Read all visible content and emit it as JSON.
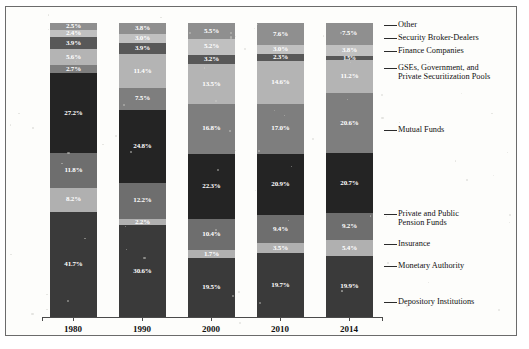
{
  "chart_data": {
    "type": "bar",
    "title": "",
    "xlabel": "",
    "ylabel": "",
    "ylim": [
      0,
      100
    ],
    "grid": false,
    "stacked": true,
    "legend_position": "right-leader-labels",
    "categories": [
      "1980",
      "1990",
      "2000",
      "2010",
      "2014"
    ],
    "series": [
      {
        "name": "Depository Institutions",
        "color": "#2b2b2b",
        "values": [
          41.7,
          30.6,
          19.5,
          19.7,
          19.9
        ]
      },
      {
        "name": "Monetary Authority",
        "color": "#adadad",
        "values": [
          0.6,
          2.2,
          1.7,
          3.5,
          5.4
        ]
      },
      {
        "name": "Insurance",
        "color": "#6e6e6e",
        "values": [
          8.2,
          12.2,
          10.4,
          9.4,
          9.2
        ]
      },
      {
        "name": "Private and Public\nPension Funds",
        "color": "#222222",
        "values": [
          11.8,
          24.8,
          22.3,
          20.9,
          20.7
        ]
      },
      {
        "name": "Mutual Funds",
        "color": "#6b6b6b",
        "values": [
          27.2,
          7.5,
          16.8,
          17.0,
          20.6
        ]
      },
      {
        "name": "GSEs, Government, and\nPrivate Securitization Pools",
        "color": "#a8a8a8",
        "values": [
          2.7,
          11.4,
          13.5,
          14.6,
          11.2
        ]
      },
      {
        "name": "Finance Companies",
        "color": "#585858",
        "values": [
          3.9,
          3.9,
          3.2,
          2.3,
          1.5
        ]
      },
      {
        "name": "Security Broker-Dealers",
        "color": "#c0c0c0",
        "values": [
          2.4,
          3.0,
          5.2,
          3.0,
          3.8
        ]
      },
      {
        "name": "Other",
        "color": "#8f8f8f",
        "values": [
          2.5,
          3.8,
          5.5,
          7.6,
          7.5
        ]
      }
    ],
    "columns": [
      {
        "year": "1980",
        "segments": [
          {
            "label": "Other",
            "value": "2.5%",
            "pct": 2.5,
            "color": "#8f8f8f",
            "text": "#ffffff"
          },
          {
            "label": "Security Broker-Dealers",
            "value": "2.4%",
            "pct": 2.4,
            "color": "#c0c0c0",
            "text": "#ffffff"
          },
          {
            "label": "Finance Companies",
            "value": "3.9%",
            "pct": 3.9,
            "color": "#585858",
            "text": "#ffffff"
          },
          {
            "label": "GSEs, Government, and Private Securitization Pools",
            "value": "5.6%",
            "pct": 5.6,
            "color": "#b4b4b4",
            "text": "#ffffff"
          },
          {
            "label": "Mutual Funds",
            "value": "2.7%",
            "pct": 2.7,
            "color": "#7e7e7e",
            "text": "#ffffff"
          },
          {
            "label": "Private and Public Pension Funds",
            "value": "27.2%",
            "pct": 27.2,
            "color": "#242424",
            "text": "#ffffff"
          },
          {
            "label": "Insurance",
            "value": "11.8%",
            "pct": 11.8,
            "color": "#6e6e6e",
            "text": "#ffffff"
          },
          {
            "label": "Monetary Authority",
            "value": "8.2%",
            "pct": 8.2,
            "color": "#b0b0b0",
            "text": "#ffffff"
          },
          {
            "label": "Depository Institutions",
            "value": "41.7%",
            "pct": 35.7,
            "color": "#3a3a3a",
            "text": "#ffffff"
          }
        ]
      },
      {
        "year": "1990",
        "segments": [
          {
            "label": "Other",
            "value": "3.8%",
            "pct": 3.8,
            "color": "#8f8f8f",
            "text": "#ffffff"
          },
          {
            "label": "Security Broker-Dealers",
            "value": "3.0%",
            "pct": 3.0,
            "color": "#c0c0c0",
            "text": "#ffffff"
          },
          {
            "label": "Finance Companies",
            "value": "3.9%",
            "pct": 3.9,
            "color": "#585858",
            "text": "#ffffff"
          },
          {
            "label": "GSEs, Government, and Private Securitization Pools",
            "value": "11.4%",
            "pct": 11.4,
            "color": "#b4b4b4",
            "text": "#ffffff"
          },
          {
            "label": "Mutual Funds",
            "value": "7.5%",
            "pct": 7.5,
            "color": "#7e7e7e",
            "text": "#ffffff"
          },
          {
            "label": "Private and Public Pension Funds",
            "value": "24.8%",
            "pct": 24.8,
            "color": "#242424",
            "text": "#ffffff"
          },
          {
            "label": "Insurance",
            "value": "12.2%",
            "pct": 12.2,
            "color": "#6e6e6e",
            "text": "#ffffff"
          },
          {
            "label": "Monetary Authority",
            "value": "2.2%",
            "pct": 2.2,
            "color": "#b0b0b0",
            "text": "#ffffff"
          },
          {
            "label": "Depository Institutions",
            "value": "30.6%",
            "pct": 31.2,
            "color": "#3a3a3a",
            "text": "#ffffff"
          }
        ]
      },
      {
        "year": "2000",
        "segments": [
          {
            "label": "Other",
            "value": "5.5%",
            "pct": 5.5,
            "color": "#8f8f8f",
            "text": "#ffffff"
          },
          {
            "label": "Security Broker-Dealers",
            "value": "5.2%",
            "pct": 5.2,
            "color": "#c0c0c0",
            "text": "#ffffff"
          },
          {
            "label": "Finance Companies",
            "value": "3.2%",
            "pct": 3.2,
            "color": "#585858",
            "text": "#ffffff"
          },
          {
            "label": "GSEs, Government, and Private Securitization Pools",
            "value": "13.5%",
            "pct": 13.5,
            "color": "#b4b4b4",
            "text": "#ffffff"
          },
          {
            "label": "Mutual Funds",
            "value": "16.8%",
            "pct": 16.8,
            "color": "#7e7e7e",
            "text": "#ffffff"
          },
          {
            "label": "Private and Public Pension Funds",
            "value": "22.3%",
            "pct": 22.3,
            "color": "#242424",
            "text": "#ffffff"
          },
          {
            "label": "Insurance",
            "value": "10.4%",
            "pct": 10.4,
            "color": "#6e6e6e",
            "text": "#ffffff"
          },
          {
            "label": "Monetary Authority",
            "value": "1.7%",
            "pct": 2.6,
            "color": "#b0b0b0",
            "text": "#ffffff"
          },
          {
            "label": "Depository Institutions",
            "value": "19.5%",
            "pct": 20.0,
            "color": "#3a3a3a",
            "text": "#ffffff"
          }
        ]
      },
      {
        "year": "2010",
        "segments": [
          {
            "label": "Other",
            "value": "7.6%",
            "pct": 7.6,
            "color": "#8f8f8f",
            "text": "#ffffff"
          },
          {
            "label": "Security Broker-Dealers",
            "value": "3.0%",
            "pct": 3.0,
            "color": "#c0c0c0",
            "text": "#ffffff"
          },
          {
            "label": "Finance Companies",
            "value": "2.3%",
            "pct": 2.3,
            "color": "#585858",
            "text": "#ffffff"
          },
          {
            "label": "GSEs, Government, and Private Securitization Pools",
            "value": "14.6%",
            "pct": 14.6,
            "color": "#b4b4b4",
            "text": "#ffffff"
          },
          {
            "label": "Mutual Funds",
            "value": "17.0%",
            "pct": 17.0,
            "color": "#7e7e7e",
            "text": "#ffffff"
          },
          {
            "label": "Private and Public Pension Funds",
            "value": "20.9%",
            "pct": 20.9,
            "color": "#242424",
            "text": "#ffffff"
          },
          {
            "label": "Insurance",
            "value": "9.4%",
            "pct": 9.4,
            "color": "#6e6e6e",
            "text": "#ffffff"
          },
          {
            "label": "Monetary Authority",
            "value": "3.5%",
            "pct": 3.5,
            "color": "#b0b0b0",
            "text": "#ffffff"
          },
          {
            "label": "Depository Institutions",
            "value": "19.7%",
            "pct": 21.7,
            "color": "#3a3a3a",
            "text": "#ffffff"
          }
        ]
      },
      {
        "year": "2014",
        "segments": [
          {
            "label": "Other",
            "value": "7.5%",
            "pct": 7.5,
            "color": "#8f8f8f",
            "text": "#ffffff"
          },
          {
            "label": "Security Broker-Dealers",
            "value": "3.8%",
            "pct": 3.8,
            "color": "#c0c0c0",
            "text": "#ffffff"
          },
          {
            "label": "Finance Companies",
            "value": "1.5%",
            "pct": 1.5,
            "color": "#585858",
            "text": "#ffffff"
          },
          {
            "label": "GSEs, Government, and Private Securitization Pools",
            "value": "11.2%",
            "pct": 11.2,
            "color": "#b4b4b4",
            "text": "#ffffff"
          },
          {
            "label": "Mutual Funds",
            "value": "20.6%",
            "pct": 20.6,
            "color": "#7e7e7e",
            "text": "#ffffff"
          },
          {
            "label": "Private and Public Pension Funds",
            "value": "20.7%",
            "pct": 20.7,
            "color": "#242424",
            "text": "#ffffff"
          },
          {
            "label": "Insurance",
            "value": "9.2%",
            "pct": 9.2,
            "color": "#6e6e6e",
            "text": "#ffffff"
          },
          {
            "label": "Monetary Authority",
            "value": "5.4%",
            "pct": 5.4,
            "color": "#b0b0b0",
            "text": "#ffffff"
          },
          {
            "label": "Depository Institutions",
            "value": "19.9%",
            "pct": 20.9,
            "color": "#3a3a3a",
            "text": "#ffffff"
          }
        ]
      }
    ]
  },
  "axis": {
    "years": [
      "1980",
      "1990",
      "2000",
      "2010",
      "2014"
    ]
  },
  "leader_labels": [
    {
      "text": "Other",
      "top": 14
    },
    {
      "text": "Security Broker-Dealers",
      "top": 27
    },
    {
      "text": "Finance Companies",
      "top": 40
    },
    {
      "text": "GSEs, Government, and\nPrivate Securitization Pools",
      "top": 57
    },
    {
      "text": "Mutual Funds",
      "top": 119
    },
    {
      "text": "Private and Public\nPension Funds",
      "top": 203
    },
    {
      "text": "Insurance",
      "top": 233
    },
    {
      "text": "Monetary Authority",
      "top": 255
    },
    {
      "text": "Depository Institutions",
      "top": 291
    }
  ]
}
